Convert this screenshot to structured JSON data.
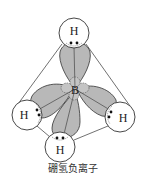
{
  "diagram": {
    "title": "硼氢负离子",
    "central_atom": {
      "label": "B",
      "x": 75,
      "y": 89
    },
    "hydrogens": [
      {
        "id": "top",
        "label": "H",
        "cx": 74,
        "cy": 33,
        "r": 15
      },
      {
        "id": "left",
        "label": "H",
        "cx": 27,
        "cy": 115,
        "r": 15
      },
      {
        "id": "right",
        "label": "H",
        "cx": 120,
        "cy": 117,
        "r": 15
      },
      {
        "id": "bottom",
        "label": "H",
        "cx": 60,
        "cy": 147,
        "r": 15
      }
    ],
    "electron_pairs_per_bond": 2,
    "colors": {
      "orbital_fill": "#b8b8b8",
      "outline": "#333333",
      "background": "#ffffff"
    }
  }
}
